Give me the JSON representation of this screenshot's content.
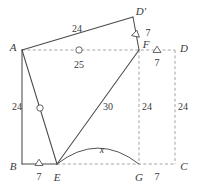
{
  "figure": {
    "stroke_color": "#4a4a4a",
    "dashed_color": "#9a9a9a",
    "text_color": "#3a3a3a",
    "background": "#ffffff",
    "width": 197,
    "height": 191,
    "points": [
      {
        "name": "A",
        "label": "A",
        "x": 22,
        "y": 50,
        "label_x": 13,
        "label_y": 47
      },
      {
        "name": "B",
        "label": "B",
        "x": 22,
        "y": 164,
        "label_x": 13,
        "label_y": 166
      },
      {
        "name": "C",
        "label": "C",
        "x": 175,
        "y": 164,
        "label_x": 184,
        "label_y": 166
      },
      {
        "name": "D",
        "label": "D",
        "x": 175,
        "y": 50,
        "label_x": 184,
        "label_y": 48
      },
      {
        "name": "E",
        "label": "E",
        "x": 57,
        "y": 164,
        "label_x": 57,
        "label_y": 177
      },
      {
        "name": "F",
        "label": "F",
        "x": 139,
        "y": 50,
        "label_x": 146,
        "label_y": 44
      },
      {
        "name": "G",
        "label": "G",
        "x": 139,
        "y": 164,
        "label_x": 139,
        "label_y": 177
      },
      {
        "name": "Dp",
        "label": "D'",
        "x": 133,
        "y": 17,
        "label_x": 141,
        "label_y": 11
      }
    ],
    "solid_edges": [
      {
        "name": "edge-A-Dprime",
        "from": "A",
        "to": "Dp"
      },
      {
        "name": "edge-Dprime-F",
        "from": "Dp",
        "to": "F"
      },
      {
        "name": "edge-A-B",
        "from": "A",
        "to": "B"
      },
      {
        "name": "edge-A-E",
        "from": "A",
        "to": "E"
      },
      {
        "name": "edge-E-F",
        "from": "E",
        "to": "F"
      },
      {
        "name": "edge-B-E",
        "from": "B",
        "to": "E"
      }
    ],
    "dashed_edges": [
      {
        "name": "edge-A-D-dashed",
        "from": "A",
        "to": "D"
      },
      {
        "name": "edge-D-C-dashed",
        "from": "D",
        "to": "C"
      },
      {
        "name": "edge-E-C-dashed",
        "from": "E",
        "to": "C"
      },
      {
        "name": "edge-F-G-dashed",
        "from": "F",
        "to": "G"
      }
    ],
    "arc": {
      "name": "arc-x-EG",
      "from": "E",
      "to": "G",
      "bulge_y": 148
    },
    "tick_marks": [
      {
        "name": "tick-BE",
        "x": 39,
        "y": 163,
        "rotation": 0,
        "shape": "triangle"
      },
      {
        "name": "tick-FD",
        "x": 157,
        "y": 50,
        "rotation": 0,
        "shape": "triangle"
      },
      {
        "name": "tick-Dprime-F",
        "x": 136,
        "y": 34,
        "rotation": 12,
        "shape": "triangle"
      }
    ],
    "circle_marks": [
      {
        "name": "circle-mark-AD",
        "x": 79,
        "y": 50,
        "r": 3.2
      },
      {
        "name": "circle-mark-AE",
        "x": 40,
        "y": 108,
        "r": 3.2
      }
    ],
    "length_labels": [
      {
        "name": "length-A-Dprime",
        "text": "24",
        "x": 77,
        "y": 29,
        "style": "len"
      },
      {
        "name": "length-A-D",
        "text": "25",
        "x": 79,
        "y": 65,
        "style": "len"
      },
      {
        "name": "length-Dprime-F",
        "text": "7",
        "x": 148,
        "y": 33,
        "style": "len"
      },
      {
        "name": "length-F-D",
        "text": "7",
        "x": 157,
        "y": 63,
        "style": "len"
      },
      {
        "name": "length-A-B",
        "text": "24",
        "x": 17,
        "y": 107,
        "style": "len"
      },
      {
        "name": "length-E-F",
        "text": "30",
        "x": 108,
        "y": 107,
        "style": "len"
      },
      {
        "name": "length-F-G",
        "text": "24",
        "x": 147,
        "y": 107,
        "style": "len"
      },
      {
        "name": "length-D-C",
        "text": "24",
        "x": 183,
        "y": 107,
        "style": "len"
      },
      {
        "name": "length-B-E",
        "text": "7",
        "x": 39,
        "y": 177,
        "style": "len"
      },
      {
        "name": "length-G-C",
        "text": "7",
        "x": 157,
        "y": 177,
        "style": "len"
      },
      {
        "name": "length-E-G",
        "text": "x",
        "x": 102,
        "y": 150,
        "style": "var"
      }
    ]
  }
}
